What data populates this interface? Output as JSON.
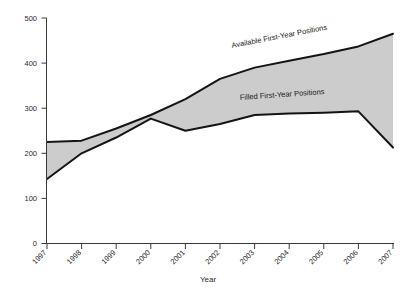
{
  "chart_data": {
    "type": "area",
    "title": "",
    "subtitle": "",
    "xlabel": "Year",
    "ylabel": "",
    "categories": [
      "1997",
      "1998",
      "1999",
      "2000",
      "2001",
      "2002",
      "2003",
      "2004",
      "2005",
      "2006",
      "2007"
    ],
    "x": [
      1997,
      1998,
      1999,
      2000,
      2001,
      2002,
      2003,
      2004,
      2005,
      2006,
      2007
    ],
    "xlim": [
      1997,
      2007
    ],
    "ylim": [
      0,
      500
    ],
    "yticks": [
      0,
      100,
      200,
      300,
      400,
      500
    ],
    "ytick_labels": [
      "0",
      "100",
      "200",
      "300",
      "400",
      "500"
    ],
    "grid": false,
    "legend": "inline-annotations",
    "series": [
      {
        "name": "Available First-Year Positions",
        "values": [
          225,
          228,
          255,
          285,
          320,
          365,
          390,
          405,
          420,
          437,
          465
        ],
        "color": "#141414",
        "role": "upper-bound"
      },
      {
        "name": "Filled First-Year Positions",
        "values": [
          143,
          200,
          235,
          277,
          250,
          265,
          285,
          288,
          290,
          293,
          213
        ],
        "color": "#141414",
        "role": "lower-bound"
      }
    ],
    "fill_between": {
      "label": "gap between available and filled positions",
      "color": "#cccccc"
    },
    "annotations": [
      {
        "text": "Available First-Year Positions",
        "near_series": "Available First-Year Positions",
        "rotation_deg": -11
      },
      {
        "text": "Filled First-Year Positions",
        "near_series": "Filled First-Year Positions",
        "rotation_deg": -4
      }
    ]
  },
  "axes": {
    "x_axis_title": "Year",
    "y_axis_title": ""
  }
}
